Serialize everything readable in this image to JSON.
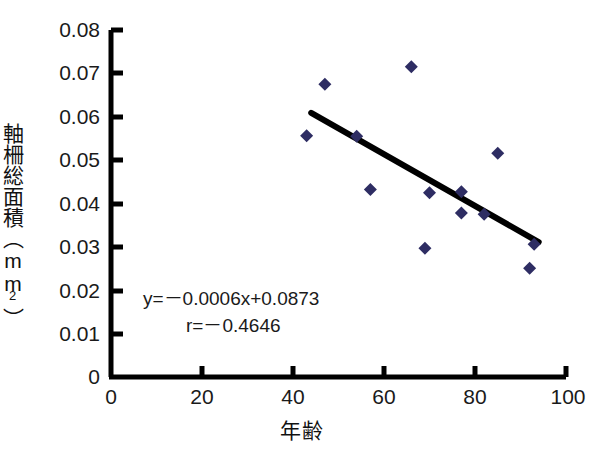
{
  "chart_data": {
    "type": "scatter",
    "title": "",
    "xlabel": "年齢",
    "ylabel": "軸柵総面積 (mm2)",
    "ylabel_text": "軸柵総面積（mm",
    "ylabel_sup": "2",
    "ylabel_tail": "）",
    "xlim": [
      0,
      100
    ],
    "ylim": [
      0,
      0.08
    ],
    "xticks": [
      0,
      20,
      40,
      60,
      80,
      100
    ],
    "xtick_labels": [
      "0",
      "20",
      "40",
      "60",
      "80",
      "100"
    ],
    "yticks": [
      0,
      0.01,
      0.02,
      0.03,
      0.04,
      0.05,
      0.06,
      0.07,
      0.08
    ],
    "ytick_labels": [
      "0",
      "0.01",
      "0.02",
      "0.03",
      "0.04",
      "0.05",
      "0.06",
      "0.07",
      "0.08"
    ],
    "grid": false,
    "legend": false,
    "marker": "diamond",
    "marker_color": "#2e2d63",
    "axis_color": "#000000",
    "trendline_color": "#000000",
    "points": [
      {
        "x": 43,
        "y": 0.0556
      },
      {
        "x": 47,
        "y": 0.0675
      },
      {
        "x": 54,
        "y": 0.0555
      },
      {
        "x": 57,
        "y": 0.0432
      },
      {
        "x": 66,
        "y": 0.0715
      },
      {
        "x": 69,
        "y": 0.0297
      },
      {
        "x": 77,
        "y": 0.0427
      },
      {
        "x": 77,
        "y": 0.0378
      },
      {
        "x": 82,
        "y": 0.0375
      },
      {
        "x": 85,
        "y": 0.0516
      },
      {
        "x": 92,
        "y": 0.0251
      },
      {
        "x": 93,
        "y": 0.0306
      },
      {
        "x": 70,
        "y": 0.0425
      }
    ],
    "trendline": {
      "x_start": 44,
      "y_start": 0.0609,
      "x_end": 94,
      "y_end": 0.0311,
      "slope": -0.0006,
      "intercept": 0.0873
    },
    "annotations": {
      "equation": "y=－0.0006x+0.0873",
      "correlation": "r=－0.4646"
    },
    "r_value": -0.4646
  }
}
